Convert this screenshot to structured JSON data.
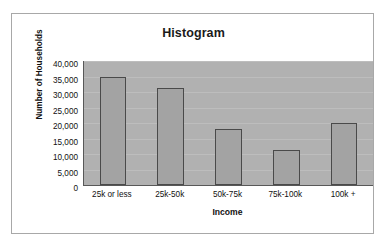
{
  "chart_data": {
    "type": "bar",
    "title": "Histogram",
    "xlabel": "Income",
    "ylabel": "Number of Households",
    "categories": [
      "25k or less",
      "25k-50k",
      "50k-75k",
      "75k-100k",
      "100k +"
    ],
    "values": [
      34800,
      31400,
      18000,
      11200,
      20000
    ],
    "ylim": [
      0,
      40000
    ],
    "yticks": [
      "40,000",
      "35,000",
      "30,000",
      "25,000",
      "20,000",
      "15,000",
      "10,000",
      "5,000",
      "0"
    ],
    "ytick_values": [
      40000,
      35000,
      30000,
      25000,
      20000,
      15000,
      10000,
      5000,
      0
    ],
    "grid": true,
    "legend": false,
    "colors": {
      "bar_fill": "#a3a3a3",
      "bar_border": "#4a4a4a",
      "plot_background": "#b1b1b1",
      "gridline": "#bdbdbd",
      "axis": "#585858",
      "text": "#111111",
      "frame": "#a8a8a8",
      "page_background": "#ffffff"
    }
  }
}
